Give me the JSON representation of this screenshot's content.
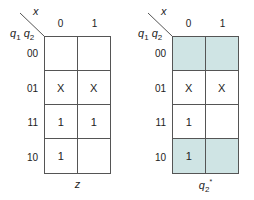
{
  "colors": {
    "shade": "#cfe4e4",
    "line": "#555555",
    "text": "#222222"
  },
  "maps": [
    {
      "id": "z",
      "column_variable": "x",
      "row_variables": [
        "q1",
        "q2"
      ],
      "column_headers": [
        "0",
        "1"
      ],
      "row_headers": [
        "00",
        "01",
        "11",
        "10"
      ],
      "cells": [
        [
          "",
          ""
        ],
        [
          "X",
          "X"
        ],
        [
          "1",
          "1"
        ],
        [
          "1",
          ""
        ]
      ],
      "shaded": [],
      "label": "z"
    },
    {
      "id": "q2_star",
      "column_variable": "x",
      "row_variables": [
        "q1",
        "q2"
      ],
      "column_headers": [
        "0",
        "1"
      ],
      "row_headers": [
        "00",
        "01",
        "11",
        "10"
      ],
      "cells": [
        [
          "",
          ""
        ],
        [
          "X",
          "X"
        ],
        [
          "1",
          ""
        ],
        [
          "1",
          ""
        ]
      ],
      "shaded": [
        [
          0,
          0
        ],
        [
          0,
          1
        ],
        [
          3,
          0
        ],
        [
          3,
          1
        ]
      ],
      "label": "q2*"
    }
  ],
  "labels": {
    "x": "x",
    "q": "q",
    "sub1": "1",
    "sub2": "2",
    "z": "z",
    "star": "*"
  }
}
